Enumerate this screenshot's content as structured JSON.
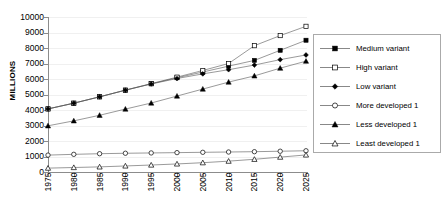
{
  "chart_data": {
    "type": "line",
    "title": "",
    "xlabel": "",
    "ylabel": "MILLIONS",
    "x": [
      1975,
      1980,
      1985,
      1990,
      1995,
      2000,
      2005,
      2010,
      2015,
      2020,
      2025
    ],
    "xtick_labels": [
      "1975",
      "1980",
      "1985",
      "1990",
      "1995",
      "2000",
      "2005",
      "2010",
      "2015",
      "2020",
      "2025"
    ],
    "ytick_labels": [
      "10000",
      "9000",
      "8000",
      "7000",
      "6000",
      "5000",
      "4000",
      "3000",
      "2000",
      "1000",
      "0"
    ],
    "ytick_values": [
      10000,
      9000,
      8000,
      7000,
      6000,
      5000,
      4000,
      3000,
      2000,
      1000,
      0
    ],
    "ylim": [
      0,
      10000
    ],
    "xlim": [
      1975,
      2025
    ],
    "grid": "horizontal",
    "legend_position": "right-outside",
    "series": [
      {
        "name": "Medium variant",
        "marker": "filled-square",
        "values": [
          4070,
          4440,
          4850,
          5280,
          5690,
          6080,
          6450,
          6830,
          7200,
          7850,
          8500
        ]
      },
      {
        "name": "High variant",
        "marker": "open-square",
        "values": [
          4070,
          4440,
          4850,
          5280,
          5700,
          6120,
          6550,
          7000,
          8150,
          8800,
          9400
        ]
      },
      {
        "name": "Low variant",
        "marker": "filled-diamond",
        "values": [
          4070,
          4440,
          4850,
          5280,
          5680,
          6030,
          6330,
          6600,
          6900,
          7250,
          7550
        ]
      },
      {
        "name": "More developed 1",
        "marker": "open-circle",
        "values": [
          1090,
          1140,
          1180,
          1210,
          1230,
          1250,
          1270,
          1290,
          1310,
          1340,
          1370
        ]
      },
      {
        "name": "Less developed 1",
        "marker": "filled-triangle",
        "values": [
          2980,
          3300,
          3660,
          4060,
          4450,
          4900,
          5350,
          5800,
          6200,
          6700,
          7150
        ]
      },
      {
        "name": "Least developed 1",
        "marker": "open-triangle",
        "values": [
          250,
          290,
          330,
          390,
          450,
          520,
          600,
          700,
          820,
          960,
          1100
        ]
      }
    ]
  },
  "legend": {
    "items": [
      {
        "label": "Medium variant",
        "marker": "filled-square"
      },
      {
        "label": "High variant",
        "marker": "open-square"
      },
      {
        "label": "Low variant",
        "marker": "filled-diamond"
      },
      {
        "label": "More developed 1",
        "marker": "open-circle"
      },
      {
        "label": "Less developed 1",
        "marker": "filled-triangle"
      },
      {
        "label": "Least developed 1",
        "marker": "open-triangle"
      }
    ]
  },
  "colors": {
    "line": "#555555",
    "marker_fill": "#000000",
    "marker_open_fill": "#ffffff",
    "grid": "#f0f0f0",
    "axis": "#8c8c8c",
    "legend_border": "#aaaaaa",
    "background": "#ffffff"
  }
}
